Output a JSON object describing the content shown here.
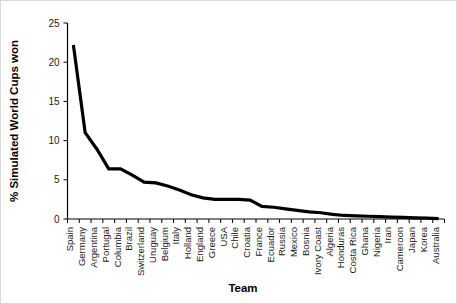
{
  "chart_data": {
    "type": "line",
    "title": "",
    "xlabel": "Team",
    "ylabel": "% Simulated World Cups won",
    "ylim": [
      0,
      25
    ],
    "yticks": [
      0,
      5,
      10,
      15,
      20,
      25
    ],
    "grid": false,
    "legend": null,
    "line_color": "#000000",
    "categories": [
      "Spain",
      "Germany",
      "Argentina",
      "Portugal",
      "Columbia",
      "Brazil",
      "Switzerland",
      "Uruguay",
      "Belgium",
      "Italy",
      "Holland",
      "England",
      "Greece",
      "USA",
      "Chile",
      "Croatia",
      "France",
      "Ecuador",
      "Russia",
      "Mexico",
      "Bosnia",
      "Ivory Coast",
      "Algeria",
      "Honduras",
      "Costa Rica",
      "Ghana",
      "Nigeria",
      "Iran",
      "Cameroon",
      "Japan",
      "Korea",
      "Australia"
    ],
    "values": [
      22.2,
      11.0,
      8.9,
      6.4,
      6.4,
      5.6,
      4.7,
      4.6,
      4.2,
      3.7,
      3.1,
      2.7,
      2.5,
      2.5,
      2.5,
      2.4,
      1.6,
      1.5,
      1.3,
      1.1,
      0.9,
      0.8,
      0.6,
      0.45,
      0.4,
      0.35,
      0.3,
      0.25,
      0.2,
      0.15,
      0.1,
      0.05
    ]
  },
  "figure": {
    "background_color": "#ffffff",
    "border_color": "#d9d9d9"
  }
}
